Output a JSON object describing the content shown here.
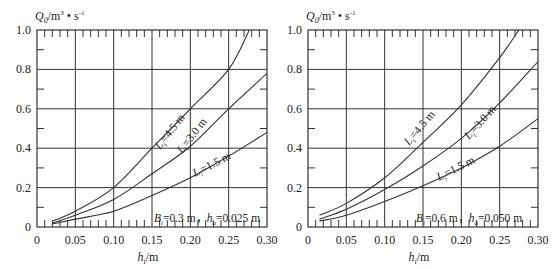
{
  "chart_data": [
    {
      "type": "line",
      "title": "",
      "ylabel": "Q0/m³·s⁻¹",
      "xlabel": "hi/m",
      "xlim": [
        0,
        0.3
      ],
      "ylim": [
        0,
        1.0
      ],
      "x_ticks": [
        "0",
        "0.05",
        "0.10",
        "0.15",
        "0.20",
        "0.25",
        "0.30"
      ],
      "y_ticks": [
        "0",
        "0.2",
        "0.4",
        "0.6",
        "0.8",
        "1.0"
      ],
      "grid": true,
      "annotation": "Bi=0.3 m，ha=0.025 m",
      "series": [
        {
          "name": "Li=4.5 m",
          "x": [
            0.02,
            0.05,
            0.1,
            0.15,
            0.2,
            0.25,
            0.277
          ],
          "values": [
            0.03,
            0.08,
            0.2,
            0.4,
            0.6,
            0.8,
            1.0
          ]
        },
        {
          "name": "Li=3.0 m",
          "x": [
            0.02,
            0.05,
            0.1,
            0.15,
            0.2,
            0.25,
            0.3
          ],
          "values": [
            0.02,
            0.06,
            0.14,
            0.27,
            0.41,
            0.6,
            0.78
          ]
        },
        {
          "name": "Li=1.5 m",
          "x": [
            0.02,
            0.05,
            0.1,
            0.15,
            0.2,
            0.25,
            0.3
          ],
          "values": [
            0.015,
            0.04,
            0.08,
            0.16,
            0.25,
            0.36,
            0.48
          ]
        }
      ]
    },
    {
      "type": "line",
      "title": "",
      "ylabel": "Q0/m³·s⁻¹",
      "xlabel": "hi/m",
      "xlim": [
        0,
        0.3
      ],
      "ylim": [
        0,
        1.0
      ],
      "x_ticks": [
        "0",
        "0.05",
        "0.10",
        "0.15",
        "0.20",
        "0.25",
        "0.30"
      ],
      "y_ticks": [
        "0",
        "0.2",
        "0.4",
        "0.6",
        "0.8",
        "1.0"
      ],
      "grid": true,
      "annotation": "Bi=0.6 m，ha=0.050 m",
      "series": [
        {
          "name": "Li=4.5 m",
          "x": [
            0.015,
            0.05,
            0.1,
            0.15,
            0.2,
            0.25,
            0.275
          ],
          "values": [
            0.06,
            0.12,
            0.25,
            0.43,
            0.62,
            0.86,
            1.0
          ]
        },
        {
          "name": "Li=3.0 m",
          "x": [
            0.015,
            0.05,
            0.1,
            0.15,
            0.2,
            0.25,
            0.3
          ],
          "values": [
            0.04,
            0.09,
            0.19,
            0.31,
            0.45,
            0.63,
            0.84
          ]
        },
        {
          "name": "Li=1.5 m",
          "x": [
            0.015,
            0.05,
            0.1,
            0.15,
            0.2,
            0.25,
            0.3
          ],
          "values": [
            0.03,
            0.06,
            0.13,
            0.21,
            0.3,
            0.41,
            0.55
          ]
        }
      ]
    }
  ],
  "labels": {
    "y_axis_label": "Q",
    "y_axis_sub": "0",
    "y_axis_unit": "/m",
    "y_axis_sup1": "3",
    "y_axis_dot": " • s",
    "y_axis_sup2": "-1",
    "x_axis_label": "h",
    "x_axis_sub": "i",
    "x_axis_unit": "/m",
    "curve_prefix": "L",
    "curve_sub": "i",
    "curve_45": "=4.5 m",
    "curve_30": "=3.0 m",
    "curve_15": "=1.5 m",
    "left_b": "B",
    "left_b_sub": "i",
    "left_b_val": "=0.3 m，",
    "left_h": "h",
    "left_h_sub": "a",
    "left_h_val": "=0.025 m",
    "right_b_val": "=0.6 m，",
    "right_h_val": "=0.050 m"
  }
}
